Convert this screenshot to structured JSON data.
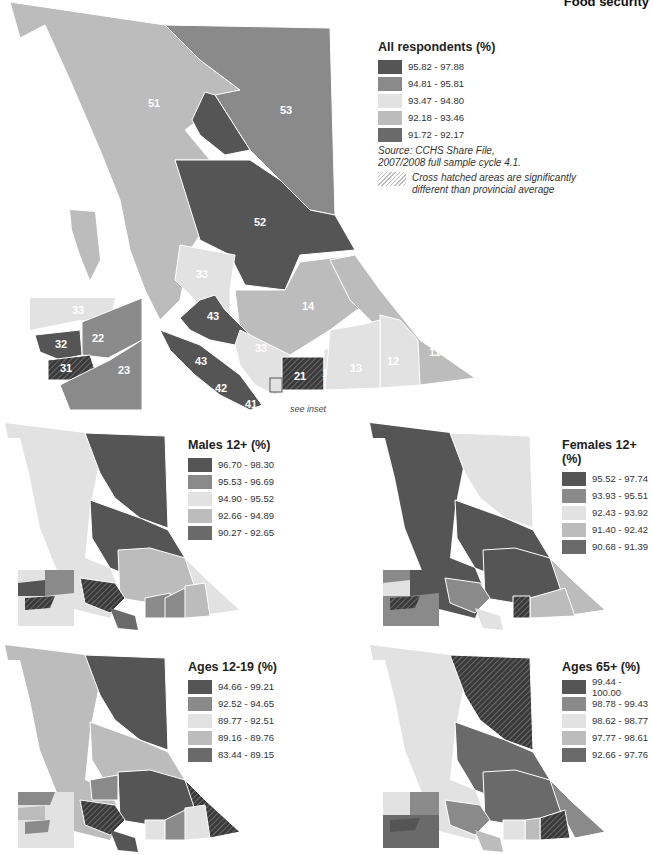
{
  "header": {
    "title": "Food security"
  },
  "main_map": {
    "legend_title": "All respondents (%)",
    "classes": [
      {
        "label": "95.82 - 97.88",
        "color": "#555555"
      },
      {
        "label": "94.81 - 95.81",
        "color": "#8a8a8a"
      },
      {
        "label": "93.47 - 94.80",
        "color": "#e2e2e2"
      },
      {
        "label": "92.18 - 93.46",
        "color": "#bcbcbc"
      },
      {
        "label": "91.72 - 92.17",
        "color": "#6a6a6a"
      }
    ],
    "source_line1": "Source: CCHS Share File,",
    "source_line2": "2007/2008 full sample cycle 4.1.",
    "hatch_note_line1": "Cross hatched areas are significantly",
    "hatch_note_line2": "different than provincial average",
    "see_inset": "see inset",
    "region_labels": {
      "r51": "51",
      "r53": "53",
      "r52": "52",
      "r33a": "33",
      "r14": "14",
      "r43a": "43",
      "r43b": "43",
      "r33b": "33",
      "r42": "42",
      "r41": "41",
      "r21": "21",
      "r13": "13",
      "r12": "12",
      "r11": "11",
      "i33": "33",
      "i32": "32",
      "i22": "22",
      "i31": "31",
      "i23": "23"
    }
  },
  "males": {
    "legend_title": "Males 12+ (%)",
    "classes": [
      {
        "label": "96.70 - 98.30",
        "color": "#555555"
      },
      {
        "label": "95.53 - 96.69",
        "color": "#8a8a8a"
      },
      {
        "label": "94.90 - 95.52",
        "color": "#e2e2e2"
      },
      {
        "label": "92.66 - 94.89",
        "color": "#bcbcbc"
      },
      {
        "label": "90.27 - 92.65",
        "color": "#6a6a6a"
      }
    ]
  },
  "females": {
    "legend_title": "Females 12+ (%)",
    "classes": [
      {
        "label": "95.52 - 97.74",
        "color": "#555555"
      },
      {
        "label": "93.93 - 95.51",
        "color": "#8a8a8a"
      },
      {
        "label": "92.43 - 93.92",
        "color": "#e2e2e2"
      },
      {
        "label": "91.40 - 92.42",
        "color": "#bcbcbc"
      },
      {
        "label": "90.68 - 91.39",
        "color": "#6a6a6a"
      }
    ]
  },
  "ages_12_19": {
    "legend_title": "Ages 12-19 (%)",
    "classes": [
      {
        "label": "94.66 - 99.21",
        "color": "#555555"
      },
      {
        "label": "92.52 - 94.65",
        "color": "#8a8a8a"
      },
      {
        "label": "89.77 - 92.51",
        "color": "#e2e2e2"
      },
      {
        "label": "89.16 - 89.76",
        "color": "#bcbcbc"
      },
      {
        "label": "83.44 - 89.15",
        "color": "#6a6a6a"
      }
    ]
  },
  "ages_65": {
    "legend_title": "Ages 65+ (%)",
    "classes": [
      {
        "label": "99.44 - 100.00",
        "color": "#555555"
      },
      {
        "label": "98.78 - 99.43",
        "color": "#8a8a8a"
      },
      {
        "label": "98.62 - 98.77",
        "color": "#e2e2e2"
      },
      {
        "label": "97.77 - 98.61",
        "color": "#bcbcbc"
      },
      {
        "label": "92.66 - 97.76",
        "color": "#6a6a6a"
      }
    ]
  }
}
